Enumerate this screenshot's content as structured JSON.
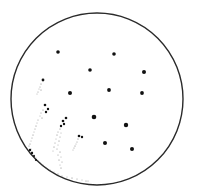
{
  "diagram": {
    "width": 199,
    "height": 192,
    "background": "#ffffff",
    "circle": {
      "cx": 97,
      "cy": 99,
      "r": 86,
      "stroke": "#2a2a2a",
      "stroke_width": 1.4
    },
    "dot_color": "#111111",
    "large_dots": [
      {
        "x": 58,
        "y": 52,
        "r": 1.8
      },
      {
        "x": 114,
        "y": 54,
        "r": 1.8
      },
      {
        "x": 90,
        "y": 70,
        "r": 1.8
      },
      {
        "x": 144,
        "y": 72,
        "r": 2.0
      },
      {
        "x": 70,
        "y": 93,
        "r": 2.0
      },
      {
        "x": 109,
        "y": 90,
        "r": 1.9
      },
      {
        "x": 142,
        "y": 93,
        "r": 1.9
      },
      {
        "x": 94,
        "y": 117,
        "r": 2.3
      },
      {
        "x": 126,
        "y": 125,
        "r": 2.2
      },
      {
        "x": 105,
        "y": 143,
        "r": 2.0
      },
      {
        "x": 132,
        "y": 149,
        "r": 2.0
      }
    ],
    "streaks": [
      {
        "name": "streak-1",
        "head": [
          {
            "x": 43,
            "y": 80,
            "r": 1.4
          }
        ],
        "tail": [
          [
            41,
            84
          ],
          [
            40,
            87
          ],
          [
            39,
            89
          ],
          [
            41,
            90
          ],
          [
            38,
            92
          ],
          [
            37,
            94
          ]
        ]
      },
      {
        "name": "streak-2",
        "head": [
          {
            "x": 45,
            "y": 105,
            "r": 1.3
          },
          {
            "x": 48,
            "y": 109,
            "r": 1.2
          },
          {
            "x": 46,
            "y": 112,
            "r": 1.2
          }
        ],
        "tail": [
          [
            43,
            110
          ],
          [
            41,
            113
          ],
          [
            40,
            116
          ],
          [
            42,
            118
          ],
          [
            38,
            120
          ],
          [
            37,
            123
          ],
          [
            36,
            126
          ],
          [
            35,
            129
          ],
          [
            34,
            132
          ],
          [
            33,
            135
          ],
          [
            32,
            138
          ],
          [
            31,
            141
          ],
          [
            30,
            144
          ],
          [
            29,
            146
          ],
          [
            31,
            149
          ],
          [
            32,
            152
          ],
          [
            34,
            155
          ],
          [
            36,
            158
          ],
          [
            38,
            161
          ],
          [
            40,
            163
          ],
          [
            43,
            165
          ],
          [
            46,
            168
          ],
          [
            50,
            170
          ],
          [
            54,
            172
          ],
          [
            58,
            174
          ],
          [
            62,
            176
          ],
          [
            67,
            177
          ],
          [
            72,
            178
          ],
          [
            77,
            179
          ],
          [
            82,
            180
          ],
          [
            86,
            181
          ],
          [
            88,
            181
          ]
        ]
      },
      {
        "name": "streak-3",
        "head": [
          {
            "x": 66,
            "y": 118,
            "r": 1.3
          },
          {
            "x": 63,
            "y": 121,
            "r": 1.3
          },
          {
            "x": 64,
            "y": 124,
            "r": 1.2
          },
          {
            "x": 61,
            "y": 126,
            "r": 1.2
          }
        ],
        "tail": [
          [
            60,
            129
          ],
          [
            58,
            132
          ],
          [
            61,
            133
          ],
          [
            57,
            135
          ],
          [
            60,
            137
          ],
          [
            56,
            139
          ],
          [
            59,
            141
          ],
          [
            55,
            143
          ],
          [
            58,
            145
          ],
          [
            54,
            147
          ],
          [
            57,
            149
          ],
          [
            53,
            151
          ],
          [
            60,
            152
          ],
          [
            58,
            155
          ],
          [
            61,
            157
          ],
          [
            59,
            160
          ],
          [
            62,
            162
          ],
          [
            60,
            165
          ],
          [
            61,
            168
          ]
        ]
      },
      {
        "name": "streak-4",
        "head": [
          {
            "x": 79,
            "y": 136,
            "r": 1.3
          },
          {
            "x": 82,
            "y": 137,
            "r": 1.2
          }
        ],
        "tail": [
          [
            78,
            139
          ],
          [
            77,
            142
          ],
          [
            76,
            144
          ],
          [
            75,
            146
          ],
          [
            74,
            148
          ],
          [
            73,
            150
          ]
        ]
      },
      {
        "name": "streak-edge",
        "head": [
          {
            "x": 30,
            "y": 150,
            "r": 1.2
          },
          {
            "x": 32,
            "y": 153,
            "r": 1.2
          },
          {
            "x": 34,
            "y": 156,
            "r": 1.1
          },
          {
            "x": 36,
            "y": 160,
            "r": 1.1
          }
        ],
        "tail": []
      }
    ]
  }
}
